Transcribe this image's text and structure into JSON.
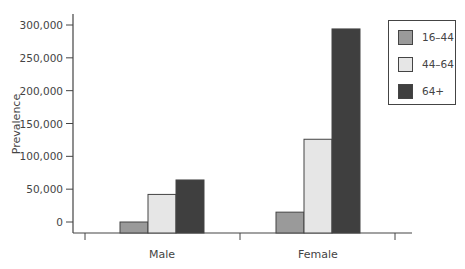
{
  "chart_data": {
    "type": "bar",
    "title": "",
    "xlabel": "",
    "ylabel": "Prevalence",
    "categories": [
      "Male",
      "Female"
    ],
    "series": [
      {
        "name": "16–44",
        "color": "#9a9a9a",
        "values": [
          0,
          15000
        ]
      },
      {
        "name": "44–64",
        "color": "#e6e6e6",
        "values": [
          42000,
          126000
        ]
      },
      {
        "name": "64+",
        "color": "#3f3f3f",
        "values": [
          64000,
          294000
        ]
      }
    ],
    "ylim": [
      0,
      300000
    ],
    "yticks": [
      "0",
      "50,000",
      "100,000",
      "150,000",
      "200,000",
      "250,000",
      "300,000"
    ],
    "grid": false,
    "legend_position": "top-right"
  },
  "axis": {
    "ylabel": "Prevalence",
    "categories": [
      "Male",
      "Female"
    ]
  },
  "legend": {
    "items": [
      "16–44",
      "44–64",
      "64+"
    ]
  }
}
